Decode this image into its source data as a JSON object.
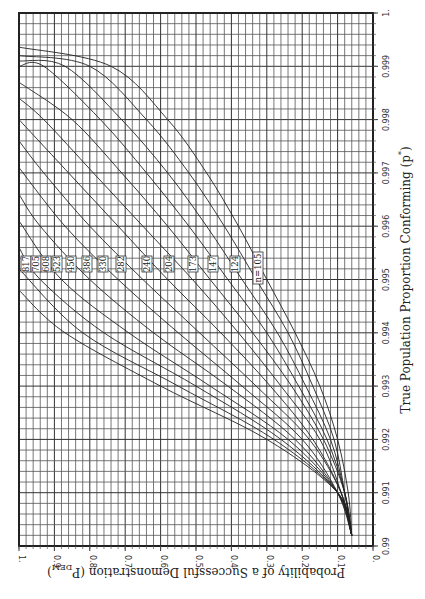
{
  "chart_data": {
    "type": "line",
    "orientation": "rotated-90-clockwise",
    "title": "",
    "xlabel": "True Population Proportion Conforming (p*)",
    "ylabel": "Probability of a Successful Demonstration (P_DEM)",
    "xlabel_parts": {
      "main": "True Population Proportion Conforming (p",
      "sup": "*",
      "end": ")"
    },
    "ylabel_parts": {
      "main": "Probability of a Successful Demonstration (P",
      "sub": "DEM",
      "end": ")"
    },
    "xlim": [
      0.99,
      1.0
    ],
    "ylim": [
      0,
      1
    ],
    "x_ticks": [
      "0.99",
      "0.991",
      "0.992",
      "0.993",
      "0.994",
      "0.995",
      "0.996",
      "0.997",
      "0.998",
      "0.999",
      "1."
    ],
    "y_ticks": [
      "0.",
      "0.1",
      "0.2",
      "0.3",
      "0.4",
      "0.5",
      "0.6",
      "0.7",
      "0.8",
      "0.9",
      "1."
    ],
    "grid": true,
    "x_grid_step": 0.0002,
    "y_grid_step": 0.02,
    "legend_position": "inline labels near p* = 0.9954",
    "series": [
      {
        "name": "817",
        "label": "817",
        "p_at_pdem1": 0.9948,
        "points": [
          [
            0.9902,
            0.06
          ],
          [
            0.991,
            0.1
          ],
          [
            0.992,
            0.3
          ],
          [
            0.993,
            0.6
          ],
          [
            0.994,
            0.87
          ],
          [
            0.9948,
            1.0
          ]
        ]
      },
      {
        "name": "705",
        "label": "705",
        "p_at_pdem1": 0.9952,
        "points": [
          [
            0.9902,
            0.06
          ],
          [
            0.991,
            0.1
          ],
          [
            0.992,
            0.28
          ],
          [
            0.993,
            0.55
          ],
          [
            0.994,
            0.82
          ],
          [
            0.9952,
            1.0
          ]
        ]
      },
      {
        "name": "608",
        "label": "608",
        "p_at_pdem1": 0.9956,
        "points": [
          [
            0.9902,
            0.06
          ],
          [
            0.991,
            0.1
          ],
          [
            0.992,
            0.26
          ],
          [
            0.993,
            0.5
          ],
          [
            0.994,
            0.76
          ],
          [
            0.995,
            0.94
          ],
          [
            0.9956,
            1.0
          ]
        ]
      },
      {
        "name": "523",
        "label": "523",
        "p_at_pdem1": 0.9961,
        "points": [
          [
            0.9902,
            0.06
          ],
          [
            0.991,
            0.1
          ],
          [
            0.992,
            0.24
          ],
          [
            0.993,
            0.46
          ],
          [
            0.994,
            0.69
          ],
          [
            0.995,
            0.88
          ],
          [
            0.9961,
            1.0
          ]
        ]
      },
      {
        "name": "450",
        "label": "450",
        "p_at_pdem1": 0.9966,
        "points": [
          [
            0.9902,
            0.06
          ],
          [
            0.991,
            0.1
          ],
          [
            0.992,
            0.22
          ],
          [
            0.993,
            0.41
          ],
          [
            0.994,
            0.62
          ],
          [
            0.995,
            0.8
          ],
          [
            0.996,
            0.94
          ],
          [
            0.9966,
            1.0
          ]
        ]
      },
      {
        "name": "386",
        "label": "386",
        "p_at_pdem1": 0.9971,
        "points": [
          [
            0.9902,
            0.06
          ],
          [
            0.991,
            0.1
          ],
          [
            0.992,
            0.2
          ],
          [
            0.993,
            0.37
          ],
          [
            0.994,
            0.55
          ],
          [
            0.995,
            0.72
          ],
          [
            0.996,
            0.87
          ],
          [
            0.9971,
            1.0
          ]
        ]
      },
      {
        "name": "330",
        "label": "330",
        "p_at_pdem1": 0.9976,
        "points": [
          [
            0.9902,
            0.06
          ],
          [
            0.991,
            0.09
          ],
          [
            0.992,
            0.18
          ],
          [
            0.993,
            0.33
          ],
          [
            0.994,
            0.49
          ],
          [
            0.995,
            0.65
          ],
          [
            0.996,
            0.8
          ],
          [
            0.997,
            0.93
          ],
          [
            0.9976,
            1.0
          ]
        ]
      },
      {
        "name": "282",
        "label": "282",
        "p_at_pdem1": 0.998,
        "points": [
          [
            0.9902,
            0.06
          ],
          [
            0.991,
            0.09
          ],
          [
            0.992,
            0.17
          ],
          [
            0.993,
            0.29
          ],
          [
            0.994,
            0.43
          ],
          [
            0.995,
            0.58
          ],
          [
            0.996,
            0.72
          ],
          [
            0.997,
            0.86
          ],
          [
            0.998,
            1.0
          ]
        ]
      },
      {
        "name": "240",
        "label": "240",
        "p_at_pdem1": 0.9984,
        "points": [
          [
            0.9902,
            0.06
          ],
          [
            0.991,
            0.09
          ],
          [
            0.992,
            0.15
          ],
          [
            0.993,
            0.26
          ],
          [
            0.994,
            0.38
          ],
          [
            0.995,
            0.51
          ],
          [
            0.996,
            0.65
          ],
          [
            0.997,
            0.79
          ],
          [
            0.998,
            0.93
          ],
          [
            0.9984,
            1.0
          ]
        ]
      },
      {
        "name": "204",
        "label": "204",
        "p_at_pdem1": 0.9987,
        "points": [
          [
            0.9902,
            0.06
          ],
          [
            0.991,
            0.08
          ],
          [
            0.992,
            0.14
          ],
          [
            0.993,
            0.23
          ],
          [
            0.994,
            0.34
          ],
          [
            0.995,
            0.46
          ],
          [
            0.996,
            0.58
          ],
          [
            0.997,
            0.71
          ],
          [
            0.998,
            0.85
          ],
          [
            0.9987,
            1.0
          ]
        ]
      },
      {
        "name": "173",
        "label": "173",
        "p_at_pdem1": 0.999,
        "points": [
          [
            0.9902,
            0.06
          ],
          [
            0.991,
            0.08
          ],
          [
            0.992,
            0.13
          ],
          [
            0.993,
            0.21
          ],
          [
            0.994,
            0.3
          ],
          [
            0.995,
            0.41
          ],
          [
            0.996,
            0.52
          ],
          [
            0.997,
            0.64
          ],
          [
            0.998,
            0.77
          ],
          [
            0.999,
            0.93
          ],
          [
            0.999,
            1.0
          ]
        ]
      },
      {
        "name": "147",
        "label": "147",
        "p_at_pdem1": 0.9991,
        "points": [
          [
            0.9902,
            0.06
          ],
          [
            0.991,
            0.08
          ],
          [
            0.992,
            0.12
          ],
          [
            0.993,
            0.19
          ],
          [
            0.994,
            0.27
          ],
          [
            0.995,
            0.37
          ],
          [
            0.996,
            0.47
          ],
          [
            0.997,
            0.58
          ],
          [
            0.998,
            0.71
          ],
          [
            0.999,
            0.87
          ],
          [
            0.9991,
            1.0
          ]
        ]
      },
      {
        "name": "124",
        "label": "124",
        "p_at_pdem1": 0.9992,
        "points": [
          [
            0.9902,
            0.06
          ],
          [
            0.991,
            0.08
          ],
          [
            0.992,
            0.11
          ],
          [
            0.993,
            0.17
          ],
          [
            0.994,
            0.24
          ],
          [
            0.995,
            0.33
          ],
          [
            0.996,
            0.42
          ],
          [
            0.997,
            0.52
          ],
          [
            0.998,
            0.64
          ],
          [
            0.999,
            0.8
          ],
          [
            0.9992,
            1.0
          ]
        ]
      },
      {
        "name": "n=105",
        "label": "n=105",
        "p_at_pdem1": 0.99936,
        "points": [
          [
            0.9902,
            0.06
          ],
          [
            0.991,
            0.07
          ],
          [
            0.992,
            0.1
          ],
          [
            0.993,
            0.15
          ],
          [
            0.994,
            0.22
          ],
          [
            0.995,
            0.3
          ],
          [
            0.996,
            0.38
          ],
          [
            0.997,
            0.47
          ],
          [
            0.998,
            0.58
          ],
          [
            0.999,
            0.74
          ],
          [
            0.99936,
            1.0
          ]
        ]
      }
    ]
  }
}
